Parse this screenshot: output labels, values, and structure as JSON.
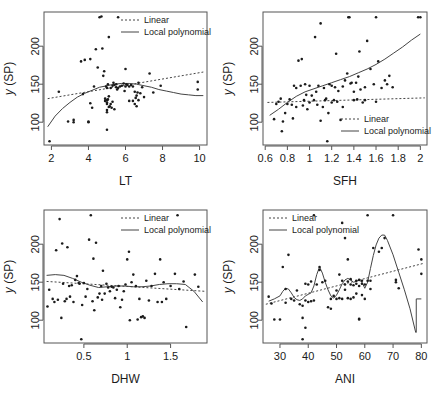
{
  "figure": {
    "type": "scatter-matrix",
    "panel_count": 4,
    "ylabel_common": "y (SP)",
    "legend": {
      "linear_label": "Linear",
      "local_label": "Local polynomial",
      "linear_style": "dashed",
      "local_style": "solid"
    },
    "colors": {
      "point": "#1b1b1b",
      "axis": "#555555",
      "curve": "#444444",
      "background": "#ffffff"
    }
  },
  "chart_data": [
    {
      "type": "scatter",
      "panel": 1,
      "title": "",
      "xlabel": "LT",
      "ylabel": "y (SP)",
      "xlim": [
        1.6,
        10.4
      ],
      "ylim": [
        70,
        245
      ],
      "xticks": [
        2,
        4,
        6,
        8,
        10
      ],
      "yticks": [
        100,
        150,
        200
      ],
      "grid": false,
      "legend_position": "top-right",
      "series": [
        {
          "name": "Linear",
          "style": "dashed",
          "x": [
            1.8,
            10.2
          ],
          "values": [
            131,
            166
          ]
        },
        {
          "name": "Local polynomial",
          "style": "solid",
          "x": [
            1.8,
            2.2,
            2.6,
            3.0,
            3.4,
            3.8,
            4.2,
            4.6,
            5.0,
            5.4,
            5.8,
            6.2,
            6.6,
            7.0,
            7.4,
            7.8,
            8.2,
            8.6,
            9.0,
            9.4,
            9.8,
            10.2
          ],
          "values": [
            94,
            108,
            118,
            126,
            133,
            138,
            142,
            146,
            148,
            150,
            151,
            151,
            150,
            148,
            146,
            143,
            141,
            139,
            137,
            136,
            135,
            135
          ]
        },
        {
          "name": "points",
          "style": "scatter",
          "x": [
            1.9,
            2.4,
            2.9,
            3.2,
            3.2,
            3.6,
            3.7,
            3.8,
            4.0,
            4.0,
            4.1,
            4.1,
            4.2,
            4.3,
            4.4,
            4.5,
            4.6,
            4.7,
            4.75,
            4.8,
            4.85,
            4.9,
            4.9,
            4.95,
            5.0,
            5.0,
            5.0,
            5.0,
            5.0,
            5.0,
            5.0,
            5.05,
            5.05,
            5.1,
            5.1,
            5.1,
            5.15,
            5.2,
            5.2,
            5.25,
            5.3,
            5.3,
            5.35,
            5.4,
            5.4,
            5.5,
            5.5,
            5.55,
            5.6,
            5.6,
            5.7,
            5.8,
            5.9,
            5.95,
            6.0,
            6.0,
            6.05,
            6.1,
            6.2,
            6.2,
            6.3,
            6.4,
            6.4,
            6.5,
            6.5,
            6.55,
            6.6,
            6.6,
            6.65,
            6.7,
            6.7,
            6.8,
            6.9,
            7.0,
            7.3,
            7.5,
            7.9,
            9.9,
            9.9
          ],
          "values": [
            75,
            140,
            101,
            103,
            100,
            180,
            137,
            182,
            100,
            101,
            125,
            183,
            119,
            147,
            196,
            172,
            238,
            239,
            197,
            161,
            167,
            128,
            131,
            147,
            90,
            113,
            116,
            124,
            126,
            129,
            145,
            130,
            150,
            120,
            134,
            212,
            121,
            124,
            145,
            119,
            127,
            148,
            152,
            117,
            149,
            146,
            150,
            143,
            145,
            238,
            147,
            148,
            151,
            141,
            147,
            170,
            150,
            149,
            128,
            147,
            149,
            128,
            147,
            124,
            140,
            132,
            121,
            135,
            139,
            129,
            152,
            138,
            146,
            133,
            164,
            139,
            148,
            143,
            153
          ]
        }
      ]
    },
    {
      "type": "scatter",
      "panel": 2,
      "title": "",
      "xlabel": "SFH",
      "ylabel": "y (SP)",
      "xlim": [
        0.58,
        2.06
      ],
      "ylim": [
        70,
        245
      ],
      "xticks": [
        0.6,
        0.8,
        1.0,
        1.2,
        1.4,
        1.6,
        1.8,
        2.0
      ],
      "yticks": [
        100,
        150,
        200
      ],
      "grid": false,
      "legend_position": "bottom-right",
      "series": [
        {
          "name": "Linear",
          "style": "dashed",
          "x": [
            0.62,
            2.04
          ],
          "values": [
            126,
            132
          ]
        },
        {
          "name": "Local polynomial",
          "style": "solid",
          "x": [
            0.64,
            0.72,
            0.8,
            0.88,
            0.96,
            1.04,
            1.12,
            1.2,
            1.28,
            1.36,
            1.44,
            1.52,
            1.6,
            1.68,
            1.76,
            1.84,
            1.92,
            2.0
          ],
          "values": [
            109,
            117,
            126,
            134,
            140,
            144,
            148,
            152,
            156,
            160,
            165,
            170,
            176,
            183,
            191,
            199,
            208,
            216
          ]
        },
        {
          "name": "points",
          "style": "scatter",
          "x": [
            0.68,
            0.7,
            0.72,
            0.74,
            0.75,
            0.76,
            0.78,
            0.8,
            0.82,
            0.84,
            0.85,
            0.86,
            0.88,
            0.88,
            0.9,
            0.92,
            0.93,
            0.94,
            0.95,
            0.96,
            0.97,
            0.98,
            1.0,
            1.0,
            1.02,
            1.04,
            1.05,
            1.06,
            1.07,
            1.08,
            1.1,
            1.1,
            1.12,
            1.13,
            1.14,
            1.15,
            1.16,
            1.17,
            1.18,
            1.2,
            1.2,
            1.22,
            1.23,
            1.24,
            1.25,
            1.26,
            1.28,
            1.3,
            1.3,
            1.32,
            1.34,
            1.35,
            1.36,
            1.37,
            1.38,
            1.4,
            1.4,
            1.42,
            1.43,
            1.44,
            1.45,
            1.46,
            1.48,
            1.5,
            1.5,
            1.52,
            1.55,
            1.58,
            1.6,
            1.6,
            1.62,
            1.65,
            1.68,
            1.7,
            1.72,
            1.75,
            1.98,
            2.0
          ],
          "values": [
            104,
            124,
            127,
            131,
            88,
            101,
            112,
            124,
            130,
            123,
            105,
            148,
            120,
            145,
            181,
            148,
            183,
            122,
            129,
            150,
            136,
            117,
            126,
            148,
            135,
            129,
            212,
            140,
            123,
            148,
            102,
            230,
            120,
            145,
            129,
            131,
            75,
            112,
            150,
            126,
            148,
            129,
            146,
            190,
            127,
            141,
            103,
            120,
            147,
            155,
            164,
            238,
            238,
            151,
            152,
            140,
            129,
            152,
            130,
            160,
            193,
            143,
            126,
            129,
            146,
            207,
            170,
            150,
            127,
            238,
            180,
            145,
            155,
            150,
            161,
            146,
            238,
            238
          ]
        }
      ]
    },
    {
      "type": "scatter",
      "panel": 3,
      "title": "",
      "xlabel": "DHW",
      "ylabel": "y (SP)",
      "xlim": [
        0.04,
        1.92
      ],
      "ylim": [
        70,
        245
      ],
      "xticks": [
        0.5,
        1.0,
        1.5
      ],
      "yticks": [
        100,
        150,
        200
      ],
      "grid": false,
      "legend_position": "top-right",
      "series": [
        {
          "name": "Linear",
          "style": "dashed",
          "x": [
            0.07,
            1.9
          ],
          "values": [
            151,
            138
          ]
        },
        {
          "name": "Local polynomial",
          "style": "solid",
          "x": [
            0.07,
            0.17,
            0.27,
            0.37,
            0.47,
            0.57,
            0.67,
            0.77,
            0.87,
            0.97,
            1.07,
            1.17,
            1.27,
            1.37,
            1.47,
            1.57,
            1.67,
            1.77,
            1.87
          ],
          "values": [
            159,
            160,
            159,
            155,
            150,
            146,
            143,
            144,
            145,
            145,
            144,
            144,
            145,
            147,
            148,
            148,
            147,
            138,
            124
          ]
        },
        {
          "name": "points",
          "style": "scatter",
          "x": [
            0.08,
            0.1,
            0.14,
            0.16,
            0.18,
            0.2,
            0.22,
            0.24,
            0.25,
            0.26,
            0.28,
            0.3,
            0.31,
            0.33,
            0.34,
            0.36,
            0.38,
            0.4,
            0.42,
            0.44,
            0.45,
            0.47,
            0.48,
            0.5,
            0.52,
            0.54,
            0.56,
            0.58,
            0.6,
            0.61,
            0.62,
            0.64,
            0.66,
            0.68,
            0.7,
            0.71,
            0.72,
            0.74,
            0.76,
            0.78,
            0.8,
            0.82,
            0.84,
            0.86,
            0.88,
            0.9,
            0.92,
            0.94,
            0.96,
            0.98,
            1.0,
            1.02,
            1.03,
            1.05,
            1.07,
            1.1,
            1.12,
            1.14,
            1.16,
            1.18,
            1.2,
            1.22,
            1.25,
            1.28,
            1.32,
            1.35,
            1.38,
            1.4,
            1.42,
            1.45,
            1.5,
            1.55,
            1.58,
            1.6,
            1.65,
            1.68,
            1.78,
            1.82
          ],
          "values": [
            118,
            140,
            128,
            124,
            192,
            127,
            233,
            103,
            201,
            148,
            125,
            128,
            196,
            145,
            131,
            146,
            124,
            153,
            158,
            149,
            148,
            75,
            120,
            149,
            131,
            141,
            206,
            238,
            125,
            181,
            113,
            202,
            130,
            135,
            145,
            127,
            165,
            135,
            148,
            143,
            138,
            144,
            143,
            129,
            140,
            145,
            117,
            127,
            138,
            147,
            180,
            190,
            100,
            150,
            160,
            145,
            101,
            128,
            104,
            105,
            103,
            152,
            126,
            145,
            161,
            124,
            180,
            124,
            150,
            128,
            145,
            161,
            238,
            141,
            151,
            91,
            160,
            144
          ]
        }
      ]
    },
    {
      "type": "scatter",
      "panel": 4,
      "title": "",
      "xlabel": "ANI",
      "ylabel": "y (SP)",
      "xlim": [
        24,
        82
      ],
      "ylim": [
        70,
        245
      ],
      "xticks": [
        30,
        40,
        50,
        60,
        70,
        80
      ],
      "yticks": [
        100,
        150,
        200
      ],
      "grid": false,
      "legend_position": "top-left",
      "series": [
        {
          "name": "Linear",
          "style": "dashed",
          "x": [
            25,
            81
          ],
          "values": [
            121,
            175
          ]
        },
        {
          "name": "Local polynomial",
          "style": "solid",
          "x": [
            26,
            28,
            30,
            31,
            32,
            33,
            34,
            35,
            36,
            37,
            38,
            39,
            40,
            41,
            42,
            43,
            44,
            45,
            46,
            47,
            48,
            49,
            50,
            51,
            52,
            53,
            54,
            55,
            56,
            57,
            58,
            59,
            60,
            61,
            62,
            63,
            64,
            65,
            66,
            67,
            68,
            70,
            72,
            74,
            76,
            78,
            78.2,
            78.2,
            80,
            80
          ],
          "values": [
            125,
            128,
            132,
            138,
            142,
            141,
            136,
            130,
            127,
            126,
            128,
            132,
            134,
            136,
            145,
            160,
            170,
            162,
            150,
            140,
            132,
            129,
            133,
            140,
            148,
            153,
            155,
            153,
            150,
            151,
            153,
            150,
            142,
            150,
            168,
            185,
            199,
            208,
            212,
            212,
            205,
            186,
            163,
            140,
            115,
            84,
            84,
            128,
            128,
            128
          ]
        },
        {
          "name": "points",
          "style": "scatter",
          "x": [
            26,
            27,
            28,
            30,
            31,
            32,
            32,
            33,
            34,
            35,
            36,
            37,
            38,
            38,
            38,
            39,
            39,
            39,
            40,
            40,
            41,
            41,
            42,
            42,
            43,
            44,
            44,
            45,
            46,
            47,
            48,
            48,
            49,
            50,
            50,
            51,
            51,
            52,
            52,
            52,
            53,
            53,
            53,
            54,
            54,
            54,
            55,
            55,
            55,
            56,
            56,
            57,
            57,
            57,
            58,
            58,
            58,
            58,
            59,
            59,
            59,
            60,
            60,
            61,
            61,
            62,
            62,
            63,
            65,
            66,
            67,
            70,
            71,
            71,
            72,
            79,
            80,
            80
          ],
          "values": [
            131,
            122,
            101,
            101,
            170,
            141,
            123,
            186,
            128,
            126,
            139,
            121,
            75,
            103,
            119,
            90,
            126,
            148,
            124,
            147,
            125,
            151,
            126,
            238,
            147,
            166,
            170,
            150,
            152,
            117,
            115,
            128,
            132,
            128,
            139,
            129,
            160,
            128,
            152,
            228,
            140,
            147,
            208,
            129,
            151,
            180,
            128,
            147,
            154,
            130,
            146,
            135,
            148,
            152,
            101,
            102,
            145,
            153,
            133,
            148,
            152,
            128,
            147,
            152,
            238,
            141,
            152,
            195,
            190,
            195,
            208,
            238,
            150,
            153,
            142,
            193,
            161,
            180
          ]
        }
      ]
    }
  ]
}
